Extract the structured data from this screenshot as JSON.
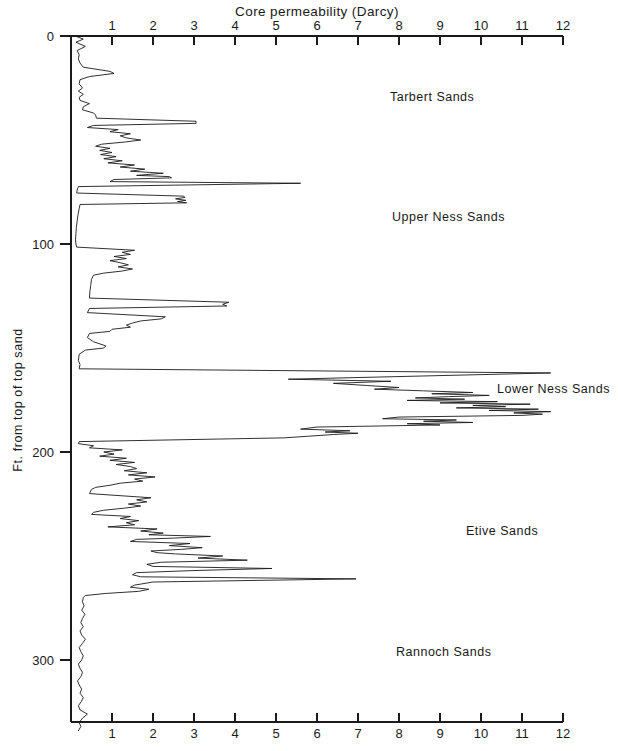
{
  "figure": {
    "background": "#ffffff",
    "ink": "#1a1a1a"
  },
  "axes": {
    "x_title": "Core permeability (Darcy)",
    "y_title": "Ft. from top of top sand",
    "x_ticks": [
      "1",
      "2",
      "3",
      "4",
      "5",
      "6",
      "7",
      "8",
      "9",
      "10",
      "11",
      "12"
    ],
    "y_ticks": [
      "0",
      "100",
      "200",
      "300"
    ]
  },
  "annotations": [
    {
      "id": "tarbert",
      "label": "Tarbert Sands",
      "x_px": 390,
      "y_px": 101
    },
    {
      "id": "upper-ness",
      "label": "Upper Ness Sands",
      "x_px": 392,
      "y_px": 221
    },
    {
      "id": "lower-ness",
      "label": "Lower Ness Sands",
      "x_px": 497,
      "y_px": 393
    },
    {
      "id": "etive",
      "label": "Etive Sands",
      "x_px": 466,
      "y_px": 535
    },
    {
      "id": "rannoch",
      "label": "Rannoch Sands",
      "x_px": 396,
      "y_px": 656
    }
  ],
  "chart_data": {
    "type": "line",
    "orientation": "vertical-depth-log",
    "title": "Core permeability (Darcy)",
    "xlabel": "Core permeability (Darcy)",
    "ylabel": "Ft. from top of top sand",
    "xlim": [
      0,
      12
    ],
    "ylim": [
      0,
      335
    ],
    "y_inverted": true,
    "grid": false,
    "legend": null,
    "x_ticks": [
      1,
      2,
      3,
      4,
      5,
      6,
      7,
      8,
      9,
      10,
      11,
      12
    ],
    "y_ticks": [
      0,
      100,
      200,
      300
    ],
    "x_axis_position": "both-top-and-bottom",
    "units": {
      "x": "Darcy",
      "y": "ft"
    },
    "zones": [
      {
        "name": "Tarbert Sands",
        "depth_from": 0,
        "depth_to": 72,
        "peak_permeability": 5.6
      },
      {
        "name": "Upper Ness Sands",
        "depth_from": 72,
        "depth_to": 160,
        "peak_permeability": 3.8
      },
      {
        "name": "Lower Ness Sands",
        "depth_from": 160,
        "depth_to": 196,
        "peak_permeability": 11.7
      },
      {
        "name": "Etive Sands",
        "depth_from": 196,
        "depth_to": 268,
        "peak_permeability": 7.0
      },
      {
        "name": "Rannoch Sands",
        "depth_from": 268,
        "depth_to": 335,
        "peak_permeability": 0.45
      }
    ],
    "series": [
      {
        "name": "Core permeability",
        "x_key": "permeability_darcy",
        "y_key": "depth_ft",
        "points": [
          [
            0.1,
            0
          ],
          [
            0.3,
            1.5
          ],
          [
            0.12,
            3
          ],
          [
            0.35,
            5
          ],
          [
            0.15,
            7
          ],
          [
            0.2,
            9
          ],
          [
            0.18,
            11
          ],
          [
            0.22,
            13
          ],
          [
            0.3,
            15
          ],
          [
            0.95,
            17
          ],
          [
            1.05,
            18
          ],
          [
            0.45,
            19.5
          ],
          [
            0.22,
            21
          ],
          [
            0.2,
            23
          ],
          [
            0.28,
            25
          ],
          [
            0.18,
            26.5
          ],
          [
            0.3,
            28
          ],
          [
            0.2,
            29.5
          ],
          [
            0.22,
            31
          ],
          [
            0.45,
            32.5
          ],
          [
            0.3,
            34
          ],
          [
            0.28,
            35.5
          ],
          [
            0.55,
            37
          ],
          [
            0.6,
            38
          ],
          [
            0.62,
            39.5
          ],
          [
            3.05,
            41
          ],
          [
            3.05,
            42
          ],
          [
            0.55,
            43
          ],
          [
            0.4,
            44
          ],
          [
            1.15,
            45
          ],
          [
            0.95,
            46
          ],
          [
            1.45,
            47
          ],
          [
            1.2,
            48
          ],
          [
            1.35,
            49
          ],
          [
            1.7,
            50
          ],
          [
            1.3,
            51
          ],
          [
            0.75,
            52
          ],
          [
            0.6,
            53
          ],
          [
            0.95,
            54
          ],
          [
            0.7,
            55
          ],
          [
            1.0,
            56
          ],
          [
            0.72,
            57
          ],
          [
            1.1,
            58
          ],
          [
            0.8,
            59
          ],
          [
            1.25,
            60
          ],
          [
            0.9,
            61
          ],
          [
            1.55,
            62
          ],
          [
            1.2,
            63
          ],
          [
            1.8,
            64
          ],
          [
            1.45,
            65
          ],
          [
            2.25,
            66
          ],
          [
            1.6,
            67
          ],
          [
            2.4,
            67.6
          ],
          [
            2.45,
            68.2
          ],
          [
            1.05,
            69
          ],
          [
            0.95,
            70
          ],
          [
            5.6,
            70.8
          ],
          [
            0.18,
            72.4
          ],
          [
            0.15,
            74
          ],
          [
            0.14,
            75.5
          ],
          [
            2.75,
            77
          ],
          [
            2.78,
            77.6
          ],
          [
            2.55,
            78.3
          ],
          [
            2.8,
            79
          ],
          [
            2.6,
            79.6
          ],
          [
            2.82,
            80.2
          ],
          [
            0.22,
            81
          ],
          [
            0.2,
            83
          ],
          [
            0.17,
            86
          ],
          [
            0.15,
            89
          ],
          [
            0.13,
            92
          ],
          [
            0.12,
            95
          ],
          [
            0.11,
            98
          ],
          [
            0.12,
            100
          ],
          [
            0.14,
            101.5
          ],
          [
            1.55,
            103
          ],
          [
            1.25,
            104
          ],
          [
            1.45,
            105
          ],
          [
            1.05,
            106
          ],
          [
            1.35,
            107
          ],
          [
            0.95,
            108
          ],
          [
            1.2,
            109
          ],
          [
            1.4,
            110
          ],
          [
            1.15,
            111
          ],
          [
            1.5,
            112
          ],
          [
            1.25,
            113
          ],
          [
            0.8,
            114
          ],
          [
            0.55,
            115
          ],
          [
            0.5,
            117
          ],
          [
            0.48,
            120
          ],
          [
            0.46,
            123
          ],
          [
            0.45,
            126
          ],
          [
            3.85,
            128
          ],
          [
            3.7,
            129
          ],
          [
            3.8,
            129.8
          ],
          [
            0.45,
            131
          ],
          [
            0.4,
            133
          ],
          [
            2.3,
            135
          ],
          [
            2.2,
            136
          ],
          [
            1.7,
            137
          ],
          [
            1.5,
            138
          ],
          [
            1.35,
            139
          ],
          [
            1.45,
            140
          ],
          [
            1.0,
            141
          ],
          [
            0.95,
            142
          ],
          [
            0.45,
            143
          ],
          [
            0.4,
            145
          ],
          [
            0.55,
            147
          ],
          [
            0.85,
            149
          ],
          [
            0.8,
            150
          ],
          [
            0.35,
            151
          ],
          [
            0.2,
            153
          ],
          [
            0.18,
            156
          ],
          [
            0.22,
            158
          ],
          [
            0.2,
            160
          ],
          [
            11.7,
            162
          ],
          [
            5.3,
            165
          ],
          [
            7.8,
            166
          ],
          [
            6.4,
            167
          ],
          [
            7.2,
            168
          ],
          [
            8.0,
            169
          ],
          [
            7.4,
            169.8
          ],
          [
            8.6,
            170.6
          ],
          [
            9.8,
            171.4
          ],
          [
            8.8,
            172
          ],
          [
            10.2,
            172.8
          ],
          [
            9.2,
            173.4
          ],
          [
            8.4,
            174
          ],
          [
            9.6,
            174.6
          ],
          [
            8.2,
            175.2
          ],
          [
            10.4,
            175.8
          ],
          [
            9.0,
            176.4
          ],
          [
            11.2,
            177
          ],
          [
            9.8,
            177.6
          ],
          [
            10.6,
            178.2
          ],
          [
            9.4,
            178.8
          ],
          [
            11.4,
            179.4
          ],
          [
            10.2,
            180
          ],
          [
            11.7,
            180.6
          ],
          [
            10.8,
            181.2
          ],
          [
            11.5,
            181.8
          ],
          [
            11.0,
            182.4
          ],
          [
            8.0,
            183.2
          ],
          [
            7.6,
            184
          ],
          [
            9.4,
            184.6
          ],
          [
            8.6,
            185.2
          ],
          [
            9.8,
            185.8
          ],
          [
            8.2,
            186.4
          ],
          [
            9.0,
            187
          ],
          [
            6.0,
            188
          ],
          [
            5.6,
            189
          ],
          [
            6.8,
            189.8
          ],
          [
            6.2,
            190.4
          ],
          [
            7.0,
            191
          ],
          [
            6.4,
            191.6
          ],
          [
            5.8,
            192.4
          ],
          [
            5.2,
            193.2
          ],
          [
            0.2,
            195
          ],
          [
            0.18,
            196
          ],
          [
            0.55,
            197
          ],
          [
            0.45,
            198
          ],
          [
            1.25,
            199
          ],
          [
            0.8,
            200
          ],
          [
            1.05,
            201
          ],
          [
            0.7,
            202
          ],
          [
            1.35,
            203
          ],
          [
            0.95,
            204
          ],
          [
            1.55,
            205
          ],
          [
            1.1,
            206
          ],
          [
            1.45,
            207
          ],
          [
            1.6,
            208
          ],
          [
            1.3,
            209
          ],
          [
            1.85,
            210
          ],
          [
            1.4,
            211
          ],
          [
            2.05,
            212
          ],
          [
            1.55,
            213
          ],
          [
            1.75,
            214
          ],
          [
            1.2,
            215
          ],
          [
            0.95,
            216
          ],
          [
            0.6,
            217
          ],
          [
            0.5,
            218
          ],
          [
            0.45,
            220
          ],
          [
            1.95,
            222
          ],
          [
            1.6,
            223
          ],
          [
            1.85,
            224
          ],
          [
            1.4,
            225
          ],
          [
            1.7,
            226
          ],
          [
            1.3,
            227
          ],
          [
            0.8,
            228
          ],
          [
            0.55,
            229
          ],
          [
            0.5,
            230
          ],
          [
            1.45,
            231
          ],
          [
            1.2,
            232
          ],
          [
            1.65,
            233
          ],
          [
            1.35,
            234
          ],
          [
            1.55,
            235
          ],
          [
            0.9,
            236
          ],
          [
            2.1,
            237
          ],
          [
            1.7,
            238
          ],
          [
            2.25,
            239
          ],
          [
            1.9,
            239.8
          ],
          [
            3.4,
            240.6
          ],
          [
            2.5,
            241.4
          ],
          [
            1.6,
            242
          ],
          [
            1.45,
            243
          ],
          [
            2.9,
            244
          ],
          [
            2.4,
            245
          ],
          [
            3.2,
            246
          ],
          [
            2.7,
            246.8
          ],
          [
            1.95,
            247.6
          ],
          [
            2.1,
            248.4
          ],
          [
            2.55,
            249
          ],
          [
            3.7,
            250
          ],
          [
            3.1,
            251
          ],
          [
            4.3,
            252
          ],
          [
            2.2,
            253
          ],
          [
            1.85,
            254
          ],
          [
            2.0,
            255
          ],
          [
            4.9,
            256
          ],
          [
            3.0,
            257
          ],
          [
            1.6,
            258
          ],
          [
            1.5,
            259
          ],
          [
            1.7,
            260
          ],
          [
            6.95,
            261
          ],
          [
            2.0,
            262.5
          ],
          [
            1.55,
            264
          ],
          [
            1.45,
            265
          ],
          [
            1.9,
            266
          ],
          [
            1.65,
            267
          ],
          [
            0.85,
            268
          ],
          [
            0.35,
            269
          ],
          [
            0.3,
            270
          ],
          [
            0.28,
            272
          ],
          [
            0.32,
            274
          ],
          [
            0.26,
            276
          ],
          [
            0.34,
            278
          ],
          [
            0.28,
            280
          ],
          [
            0.24,
            282
          ],
          [
            0.3,
            284
          ],
          [
            0.22,
            286
          ],
          [
            0.26,
            288
          ],
          [
            0.35,
            290
          ],
          [
            0.28,
            292
          ],
          [
            0.2,
            294
          ],
          [
            0.24,
            296
          ],
          [
            0.3,
            298
          ],
          [
            0.26,
            300
          ],
          [
            0.18,
            302
          ],
          [
            0.22,
            304
          ],
          [
            0.28,
            306
          ],
          [
            0.24,
            308
          ],
          [
            0.16,
            310
          ],
          [
            0.2,
            312
          ],
          [
            0.26,
            314
          ],
          [
            0.22,
            316
          ],
          [
            0.3,
            318
          ],
          [
            0.25,
            320
          ],
          [
            0.18,
            322
          ],
          [
            0.22,
            324
          ],
          [
            0.4,
            326
          ],
          [
            0.28,
            328
          ],
          [
            0.2,
            330
          ],
          [
            0.24,
            332
          ],
          [
            0.18,
            334
          ]
        ]
      }
    ]
  },
  "geometry": {
    "x0_px": 71,
    "x_per_unit_px": 41.0,
    "y0_px": 36,
    "y_per_100ft_px": 208.0,
    "top_axis_y_px": 36,
    "bottom_axis_y_px": 722
  }
}
